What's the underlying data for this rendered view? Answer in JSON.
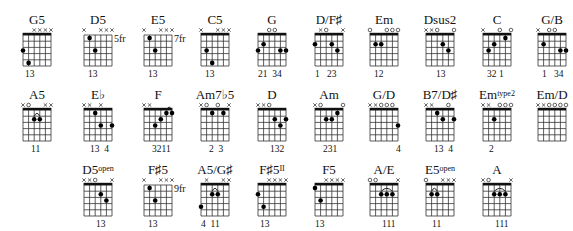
{
  "chords": [
    {
      "name": "G5",
      "sup": "",
      "row": 0,
      "cx": 37,
      "nut": true,
      "pos": "",
      "markers": [
        "",
        "",
        "x",
        "x",
        "x",
        "x"
      ],
      "dots": [
        [
          0,
          3
        ],
        [
          1,
          5
        ]
      ],
      "barre": null,
      "fingers": "13",
      "fx": -12
    },
    {
      "name": "D5",
      "sup": "",
      "row": 0,
      "cx": 98,
      "nut": false,
      "pos": "5fr",
      "markers": [
        "x",
        "",
        "",
        "x",
        "x",
        "x"
      ],
      "dots": [
        [
          1,
          1
        ],
        [
          2,
          3
        ]
      ],
      "barre": null,
      "fingers": "13",
      "fx": -10
    },
    {
      "name": "E5",
      "sup": "",
      "row": 0,
      "cx": 158,
      "nut": false,
      "pos": "7fr",
      "markers": [
        "x",
        "",
        "",
        "x",
        "x",
        "x"
      ],
      "dots": [
        [
          1,
          1
        ],
        [
          2,
          3
        ]
      ],
      "barre": null,
      "fingers": "13",
      "fx": -10
    },
    {
      "name": "C5",
      "sup": "",
      "row": 0,
      "cx": 215,
      "nut": true,
      "pos": "",
      "markers": [
        "x",
        "",
        "",
        "x",
        "x",
        "x"
      ],
      "dots": [
        [
          1,
          3
        ],
        [
          2,
          5
        ]
      ],
      "barre": null,
      "fingers": "13",
      "fx": -10
    },
    {
      "name": "G",
      "sup": "",
      "row": 0,
      "cx": 272,
      "nut": true,
      "pos": "",
      "markers": [
        "",
        "",
        "o",
        "o",
        "",
        ""
      ],
      "dots": [
        [
          0,
          3
        ],
        [
          1,
          2
        ],
        [
          4,
          3
        ],
        [
          5,
          3
        ]
      ],
      "barre": null,
      "fingers": "21  34",
      "fx": -14
    },
    {
      "name": "D/F♯",
      "sup": "",
      "row": 0,
      "cx": 329,
      "nut": true,
      "pos": "",
      "markers": [
        "",
        "x",
        "o",
        "",
        "",
        "x"
      ],
      "dots": [
        [
          0,
          2
        ],
        [
          3,
          2
        ],
        [
          4,
          3
        ]
      ],
      "barre": null,
      "fingers": "1   23",
      "fx": -14
    },
    {
      "name": "Em",
      "sup": "",
      "row": 0,
      "cx": 384,
      "nut": true,
      "pos": "",
      "markers": [
        "o",
        "",
        "",
        "o",
        "o",
        "o"
      ],
      "dots": [
        [
          1,
          2
        ],
        [
          2,
          2
        ]
      ],
      "barre": null,
      "fingers": "12",
      "fx": -10
    },
    {
      "name": "Dsus2",
      "sup": "",
      "row": 0,
      "cx": 440,
      "nut": true,
      "pos": "",
      "markers": [
        "x",
        "x",
        "o",
        "",
        "",
        "o"
      ],
      "dots": [
        [
          3,
          2
        ],
        [
          4,
          3
        ]
      ],
      "barre": null,
      "fingers": "13",
      "fx": -4
    },
    {
      "name": "C",
      "sup": "",
      "row": 0,
      "cx": 497,
      "nut": true,
      "pos": "",
      "markers": [
        "x",
        "",
        "",
        "o",
        "",
        "o"
      ],
      "dots": [
        [
          1,
          3
        ],
        [
          2,
          2
        ],
        [
          4,
          1
        ]
      ],
      "barre": null,
      "fingers": "32 1",
      "fx": -10
    },
    {
      "name": "G/B",
      "sup": "",
      "row": 0,
      "cx": 552,
      "nut": true,
      "pos": "",
      "markers": [
        "x",
        "",
        "o",
        "o",
        "",
        ""
      ],
      "dots": [
        [
          1,
          2
        ],
        [
          4,
          3
        ],
        [
          5,
          3
        ]
      ],
      "barre": null,
      "fingers": "1   34",
      "fx": -10
    },
    {
      "name": "A5",
      "sup": "",
      "row": 1,
      "cx": 37,
      "nut": true,
      "pos": "",
      "markers": [
        "x",
        "o",
        "",
        "",
        "x",
        "x"
      ],
      "dots": [
        [
          2,
          2
        ],
        [
          3,
          2
        ]
      ],
      "barre": [
        2,
        3,
        2
      ],
      "fingers": "11",
      "fx": -6
    },
    {
      "name": "E♭",
      "sup": "",
      "row": 1,
      "cx": 98,
      "nut": true,
      "pos": "",
      "markers": [
        "x",
        "x",
        "",
        "x",
        "",
        ""
      ],
      "dots": [
        [
          2,
          1
        ],
        [
          3,
          3
        ],
        [
          5,
          3
        ]
      ],
      "barre": null,
      "fingers": "13  4",
      "fx": -8
    },
    {
      "name": "F",
      "sup": "",
      "row": 1,
      "cx": 158,
      "nut": true,
      "pos": "",
      "markers": [
        "x",
        "x",
        "",
        "",
        "",
        ""
      ],
      "dots": [
        [
          2,
          3
        ],
        [
          3,
          2
        ],
        [
          4,
          1
        ],
        [
          5,
          1
        ]
      ],
      "barre": [
        4,
        5,
        1
      ],
      "fingers": "3211",
      "fx": -6
    },
    {
      "name": "Am7♭5",
      "sup": "",
      "row": 1,
      "cx": 215,
      "nut": true,
      "pos": "",
      "markers": [
        "x",
        "o",
        "",
        "o",
        "",
        "x"
      ],
      "dots": [
        [
          2,
          1
        ],
        [
          4,
          1
        ]
      ],
      "barre": null,
      "fingers": "2  3",
      "fx": -6
    },
    {
      "name": "D",
      "sup": "",
      "row": 1,
      "cx": 272,
      "nut": true,
      "pos": "",
      "markers": [
        "x",
        "x",
        "o",
        "",
        "",
        ""
      ],
      "dots": [
        [
          3,
          2
        ],
        [
          4,
          3
        ],
        [
          5,
          2
        ]
      ],
      "barre": null,
      "fingers": "132",
      "fx": -2
    },
    {
      "name": "Am",
      "sup": "",
      "row": 1,
      "cx": 329,
      "nut": true,
      "pos": "",
      "markers": [
        "x",
        "o",
        "",
        "",
        "",
        "o"
      ],
      "dots": [
        [
          2,
          2
        ],
        [
          3,
          2
        ],
        [
          4,
          1
        ]
      ],
      "barre": null,
      "fingers": "231",
      "fx": -6
    },
    {
      "name": "G/D",
      "sup": "",
      "row": 1,
      "cx": 384,
      "nut": true,
      "pos": "",
      "markers": [
        "x",
        "x",
        "o",
        "o",
        "o",
        ""
      ],
      "dots": [
        [
          5,
          3
        ]
      ],
      "barre": null,
      "fingers": "4",
      "fx": 12
    },
    {
      "name": "B7/D♯",
      "sup": "",
      "row": 1,
      "cx": 440,
      "nut": true,
      "pos": "",
      "markers": [
        "x",
        "x",
        "",
        "",
        "o",
        ""
      ],
      "dots": [
        [
          2,
          1
        ],
        [
          3,
          2
        ],
        [
          5,
          2
        ]
      ],
      "barre": null,
      "fingers": "13  4",
      "fx": -6
    },
    {
      "name": "Em",
      "sup": "type2",
      "row": 1,
      "cx": 497,
      "nut": true,
      "pos": "",
      "markers": [
        "x",
        "x",
        "",
        "o",
        "o",
        "o"
      ],
      "dots": [
        [
          2,
          2
        ]
      ],
      "barre": null,
      "fingers": "2",
      "fx": -8
    },
    {
      "name": "Em/D",
      "sup": "",
      "row": 1,
      "cx": 552,
      "nut": true,
      "pos": "",
      "markers": [
        "x",
        "x",
        "o",
        "o",
        "o",
        "o"
      ],
      "dots": [],
      "barre": null,
      "fingers": "",
      "fx": 0
    },
    {
      "name": "D5",
      "sup": "open",
      "row": 2,
      "cx": 98,
      "nut": true,
      "pos": "",
      "markers": [
        "x",
        "x",
        "o",
        "",
        "",
        "x"
      ],
      "dots": [
        [
          3,
          2
        ],
        [
          4,
          3
        ]
      ],
      "barre": null,
      "fingers": "13",
      "fx": -2
    },
    {
      "name": "F♯5",
      "sup": "",
      "row": 2,
      "cx": 158,
      "nut": false,
      "pos": "9fr",
      "markers": [
        "x",
        "",
        "",
        "x",
        "x",
        "x"
      ],
      "dots": [
        [
          1,
          1
        ],
        [
          2,
          3
        ]
      ],
      "barre": null,
      "fingers": "13",
      "fx": -10
    },
    {
      "name": "A5/G♯",
      "sup": "",
      "row": 2,
      "cx": 215,
      "nut": true,
      "pos": "",
      "markers": [
        "",
        "x",
        "",
        "",
        "x",
        "x"
      ],
      "dots": [
        [
          0,
          4
        ],
        [
          2,
          2
        ],
        [
          3,
          2
        ]
      ],
      "barre": [
        2,
        3,
        2
      ],
      "fingers": "4  11",
      "fx": -14
    },
    {
      "name": "F♯5",
      "sup": "II",
      "row": 2,
      "cx": 272,
      "nut": true,
      "pos": "",
      "markers": [
        "",
        "",
        "x",
        "x",
        "x",
        "x"
      ],
      "dots": [
        [
          0,
          2
        ],
        [
          1,
          4
        ]
      ],
      "barre": null,
      "fingers": "13",
      "fx": -12
    },
    {
      "name": "F5",
      "sup": "",
      "row": 2,
      "cx": 329,
      "nut": true,
      "pos": "",
      "markers": [
        "",
        "",
        "x",
        "x",
        "x",
        "x"
      ],
      "dots": [
        [
          0,
          1
        ],
        [
          1,
          3
        ]
      ],
      "barre": null,
      "fingers": "13",
      "fx": -14
    },
    {
      "name": "A/E",
      "sup": "",
      "row": 2,
      "cx": 384,
      "nut": true,
      "pos": "",
      "markers": [
        "o",
        "o",
        "",
        "",
        "",
        "x"
      ],
      "dots": [
        [
          2,
          2
        ],
        [
          3,
          2
        ],
        [
          4,
          2
        ]
      ],
      "barre": [
        2,
        4,
        2
      ],
      "fingers": "111",
      "fx": -2
    },
    {
      "name": "E5",
      "sup": "open",
      "row": 2,
      "cx": 440,
      "nut": true,
      "pos": "",
      "markers": [
        "o",
        "",
        "",
        "x",
        "x",
        "x"
      ],
      "dots": [
        [
          1,
          2
        ],
        [
          2,
          2
        ]
      ],
      "barre": [
        1,
        2,
        2
      ],
      "fingers": "11",
      "fx": -8
    },
    {
      "name": "A",
      "sup": "",
      "row": 2,
      "cx": 497,
      "nut": true,
      "pos": "",
      "markers": [
        "x",
        "o",
        "",
        "",
        "",
        "x"
      ],
      "dots": [
        [
          2,
          2
        ],
        [
          3,
          2
        ],
        [
          4,
          2
        ]
      ],
      "barre": [
        2,
        4,
        2
      ],
      "fingers": "111",
      "fx": -2
    }
  ],
  "layout": {
    "rowTops": [
      5,
      80,
      155
    ]
  }
}
